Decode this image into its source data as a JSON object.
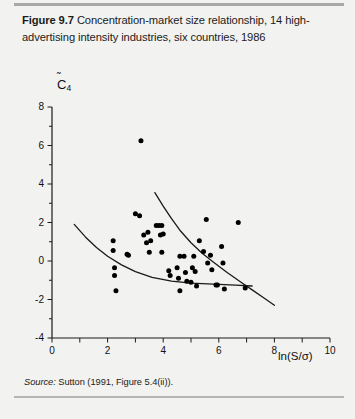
{
  "figure": {
    "label": "Figure 9.7",
    "caption": "Concentration-market size relationship, 14 high-advertising intensity industries, six countries, 1986",
    "source_word": "Source:",
    "source_text": " Sutton (1991, Figure 5.4(ii))."
  },
  "colors": {
    "page_background": "#f2f2f0",
    "rule": "#a8a8a8",
    "axis": "#1a1a1a",
    "point": "#000000",
    "curve": "#1a1a1a",
    "text": "#1b1b1b"
  },
  "chart_data": {
    "type": "scatter",
    "title": "Concentration-market size relationship, 14 high-advertising intensity industries, six countries, 1986",
    "xlabel": "ln(S/σ)",
    "ylabel": "C̄4",
    "ylabel_plain": "C4 (tilde)",
    "xlim": [
      0,
      10
    ],
    "ylim": [
      -4,
      8
    ],
    "xticks": [
      0,
      1,
      2,
      3,
      4,
      5,
      6,
      7,
      8,
      9,
      10
    ],
    "xtick_labels": [
      "0",
      "",
      "2",
      "",
      "4",
      "",
      "6",
      "",
      "8",
      "",
      "10"
    ],
    "yticks": [
      -4,
      -2,
      0,
      2,
      4,
      6,
      8
    ],
    "ytick_labels": [
      "-4",
      "-2",
      "0",
      "2",
      "4",
      "6",
      "8"
    ],
    "grid": false,
    "legend": null,
    "points": [
      [
        3.2,
        6.25
      ],
      [
        2.2,
        1.05
      ],
      [
        2.2,
        0.55
      ],
      [
        2.25,
        -0.35
      ],
      [
        2.25,
        -0.75
      ],
      [
        2.3,
        -1.55
      ],
      [
        2.7,
        0.35
      ],
      [
        2.75,
        0.3
      ],
      [
        3.0,
        2.45
      ],
      [
        3.15,
        2.35
      ],
      [
        3.3,
        1.35
      ],
      [
        3.4,
        0.95
      ],
      [
        3.45,
        1.5
      ],
      [
        3.5,
        0.45
      ],
      [
        3.55,
        1.05
      ],
      [
        3.75,
        1.85
      ],
      [
        3.85,
        1.85
      ],
      [
        3.95,
        1.85
      ],
      [
        3.9,
        1.35
      ],
      [
        3.95,
        0.45
      ],
      [
        4.0,
        1.4
      ],
      [
        4.2,
        -0.5
      ],
      [
        4.25,
        -0.75
      ],
      [
        4.5,
        -0.35
      ],
      [
        4.55,
        -0.9
      ],
      [
        4.6,
        -1.55
      ],
      [
        4.75,
        0.25
      ],
      [
        4.8,
        -0.6
      ],
      [
        4.85,
        -1.05
      ],
      [
        5.0,
        -1.1
      ],
      [
        5.1,
        0.25
      ],
      [
        5.15,
        -0.55
      ],
      [
        5.2,
        -1.3
      ],
      [
        5.3,
        1.05
      ],
      [
        5.45,
        0.5
      ],
      [
        5.55,
        2.15
      ],
      [
        5.6,
        -0.1
      ],
      [
        5.7,
        0.3
      ],
      [
        5.75,
        -0.45
      ],
      [
        5.9,
        -1.25
      ],
      [
        5.95,
        -1.25
      ],
      [
        6.1,
        0.75
      ],
      [
        6.15,
        -0.1
      ],
      [
        6.2,
        -1.45
      ],
      [
        6.7,
        2.0
      ],
      [
        6.95,
        -1.4
      ],
      [
        4.6,
        0.25
      ],
      [
        5.05,
        -0.35
      ]
    ],
    "curves": [
      {
        "name": "steep-bound-curve",
        "points": [
          [
            3.7,
            3.55
          ],
          [
            4.0,
            2.85
          ],
          [
            4.3,
            2.2
          ],
          [
            4.6,
            1.6
          ],
          [
            5.0,
            0.95
          ],
          [
            5.4,
            0.4
          ],
          [
            5.8,
            -0.05
          ],
          [
            6.3,
            -0.6
          ],
          [
            6.8,
            -1.1
          ],
          [
            7.2,
            -1.5
          ],
          [
            7.6,
            -1.9
          ],
          [
            8.0,
            -2.3
          ]
        ]
      },
      {
        "name": "shallow-bound-curve",
        "points": [
          [
            0.8,
            1.9
          ],
          [
            1.2,
            1.25
          ],
          [
            1.6,
            0.7
          ],
          [
            2.0,
            0.25
          ],
          [
            2.5,
            -0.2
          ],
          [
            3.0,
            -0.55
          ],
          [
            3.6,
            -0.85
          ],
          [
            4.3,
            -1.05
          ],
          [
            5.0,
            -1.15
          ],
          [
            5.8,
            -1.2
          ],
          [
            6.6,
            -1.25
          ],
          [
            7.2,
            -1.3
          ]
        ]
      }
    ]
  }
}
